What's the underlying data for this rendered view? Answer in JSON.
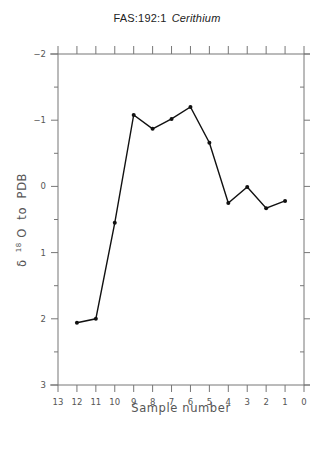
{
  "chart_data": {
    "type": "line",
    "title": "FAS:192:1",
    "title_italic": "Cerithium",
    "xlabel": "Sample number",
    "ylabel": "δ 18O to PDB",
    "ylabel_parts": {
      "delta": "δ",
      "superscript": "18",
      "rest": "O  to  PDB"
    },
    "x": [
      12,
      11,
      10,
      9,
      8,
      7,
      6,
      5,
      4,
      3,
      2,
      1
    ],
    "values": [
      2.06,
      2.0,
      0.55,
      -1.08,
      -0.87,
      -1.02,
      -1.2,
      -0.66,
      0.25,
      0.01,
      0.33,
      0.22
    ],
    "xlim": [
      13,
      0
    ],
    "ylim": [
      -2,
      3
    ],
    "y_inverted": true,
    "x_ticks": [
      13,
      12,
      11,
      10,
      9,
      8,
      7,
      6,
      5,
      4,
      3,
      2,
      1,
      0
    ],
    "x_tick_labels": [
      "13",
      "12",
      "11",
      "10",
      "9",
      "8",
      "7",
      "6",
      "5",
      "4",
      "3",
      "2",
      "1",
      "0"
    ],
    "y_ticks": [
      -2,
      -1,
      0,
      1,
      2,
      3
    ],
    "y_tick_labels": [
      "-2",
      "-1",
      "0",
      "1",
      "2",
      "3"
    ],
    "grid": false,
    "legend": null,
    "marker": "dot",
    "line_color": "#111111"
  }
}
